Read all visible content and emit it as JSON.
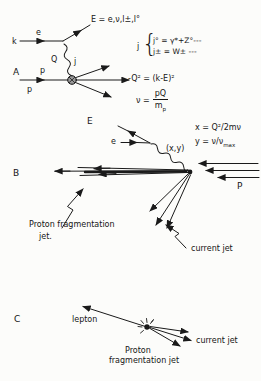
{
  "figure": {
    "panel_a": {
      "label": "A",
      "incoming_lepton": "k",
      "lepton_line_label": "e",
      "scattered_lepton_eq": "E = e,ν,l±,l°",
      "photon_label_left": "Q",
      "photon_label_right": "j",
      "proton_line_label": "p",
      "incoming_proton": "p",
      "current_bracket": {
        "j": "j",
        "brace": "{",
        "line1": "j° = γ*+Z°---",
        "line2": "j± = W± ---"
      },
      "eq_q2": "-Q² = (k-E)²",
      "eq_nu": {
        "lhs": "ν =",
        "num": "pQ",
        "den_main": "m",
        "den_sub": "p"
      }
    },
    "panel_b": {
      "label": "B",
      "scattered_lepton": "E",
      "incoming_lepton": "e",
      "exchange_label": "(x,y)",
      "eq_x": "x = Q²/2mν",
      "eq_y": {
        "main": "y = ν/ν",
        "sub": "max"
      },
      "incoming_proton": "P",
      "proton_jet_caption_line1": "Proton fragmentation",
      "proton_jet_caption_line2": "jet.",
      "current_jet_caption": "current jet"
    },
    "panel_c": {
      "label": "C",
      "lepton_caption": "lepton",
      "current_jet_caption": "current jet",
      "proton_jet_caption_line1": "Proton",
      "proton_jet_caption_line2": "fragmentation jet"
    }
  }
}
